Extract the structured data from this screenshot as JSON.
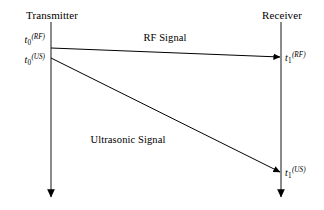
{
  "figure": {
    "type": "signal-timing-diagram",
    "background_color": "#ffffff",
    "line_color": "#000000",
    "width": 324,
    "height": 210
  },
  "nodes": [
    {
      "id": "transmitter",
      "label": "Transmitter",
      "x": 51,
      "axis_top": 22,
      "axis_bottom": 198
    },
    {
      "id": "receiver",
      "label": "Receiver",
      "x": 281,
      "axis_top": 22,
      "axis_bottom": 198
    }
  ],
  "signals": [
    {
      "id": "rf",
      "label": "RF Signal",
      "from": {
        "node": "transmitter",
        "x": 51,
        "y": 48
      },
      "to": {
        "node": "receiver",
        "x": 281,
        "y": 57
      },
      "label_x": 165,
      "label_y": 33
    },
    {
      "id": "ultrasonic",
      "label": "Ultrasonic Signal",
      "from": {
        "node": "transmitter",
        "x": 51,
        "y": 58
      },
      "to": {
        "node": "receiver",
        "x": 281,
        "y": 172
      },
      "label_x": 128,
      "label_y": 135
    }
  ],
  "time_labels": [
    {
      "id": "t0-rf",
      "base": "t",
      "sub": "0",
      "sup": "(RF)",
      "text": "t0(RF)",
      "x": 45,
      "y": 38,
      "align": "right"
    },
    {
      "id": "t0-us",
      "base": "t",
      "sub": "0",
      "sup": "(US)",
      "text": "t0(US)",
      "x": 45,
      "y": 58,
      "align": "right"
    },
    {
      "id": "t1-rf",
      "base": "t",
      "sub": "1",
      "sup": "(RF)",
      "text": "t1(RF)",
      "x": 286,
      "y": 51,
      "align": "left"
    },
    {
      "id": "t1-us",
      "base": "t",
      "sub": "1",
      "sup": "(US)",
      "text": "t1(US)",
      "x": 286,
      "y": 166,
      "align": "left"
    }
  ]
}
